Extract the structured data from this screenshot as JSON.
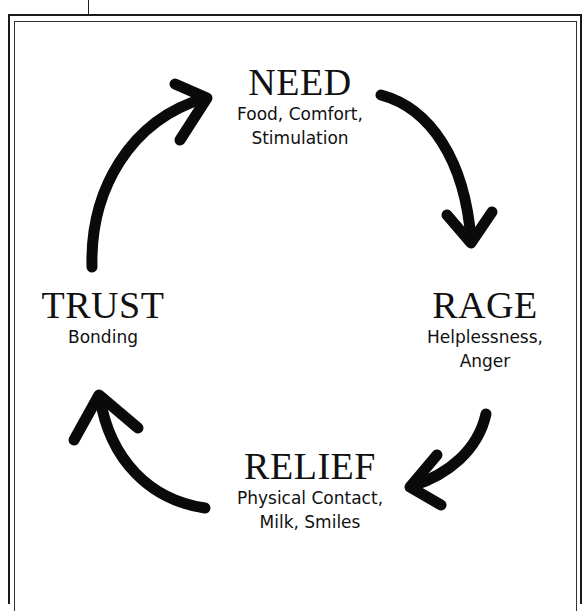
{
  "diagram": {
    "type": "cycle",
    "nodes": [
      {
        "id": "need",
        "title": "NEED",
        "lines": [
          "Food, Comfort,",
          "Stimulation"
        ]
      },
      {
        "id": "rage",
        "title": "RAGE",
        "lines": [
          "Helplessness,",
          "Anger"
        ]
      },
      {
        "id": "relief",
        "title": "RELIEF",
        "lines": [
          "Physical Contact,",
          "Milk, Smiles"
        ]
      },
      {
        "id": "trust",
        "title": "TRUST",
        "lines": [
          "Bonding"
        ]
      }
    ],
    "edges": [
      {
        "from": "need",
        "to": "rage"
      },
      {
        "from": "rage",
        "to": "relief"
      },
      {
        "from": "relief",
        "to": "trust"
      },
      {
        "from": "trust",
        "to": "need"
      }
    ]
  }
}
